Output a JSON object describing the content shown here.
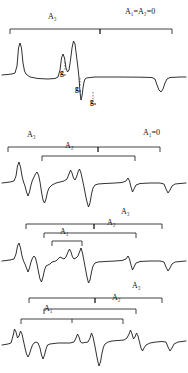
{
  "figure": {
    "type": "spectra-stack",
    "panel_count": 4,
    "background": "#ffffff",
    "trace_color": "#1a1a1a"
  },
  "labels": {
    "A3": "A₃",
    "A2": "A₂",
    "A1": "A₁",
    "g1": "g₁",
    "g2": "g₂",
    "g3": "g₃",
    "cond_top": "A₁=A₂=0",
    "cond_second": "A₁=0"
  },
  "panels": [
    {
      "index": 1,
      "condition": "A₁=A₂=0",
      "brackets": [
        {
          "label": "A₃",
          "x1": 10,
          "x2": 100,
          "y": 30,
          "label_x": 48,
          "label_y": 17
        }
      ],
      "condition_label": {
        "x": 128,
        "y": 12
      },
      "g_markers": [
        {
          "label": "g₁",
          "x": 63,
          "y": 70
        },
        {
          "label": "g₂",
          "x": 80,
          "y": 89
        },
        {
          "label": "g₃",
          "x": 94,
          "y": 101
        }
      ]
    },
    {
      "index": 2,
      "condition": "A₁=0",
      "brackets": [
        {
          "label": "A₃",
          "x1": 8,
          "x2": 160,
          "y": 148,
          "label_x": 30,
          "label_y": 136
        },
        {
          "label": "A₂",
          "x1": 42,
          "x2": 135,
          "y": 157,
          "label_x": 68,
          "label_y": 147
        }
      ],
      "condition_label": {
        "x": 146,
        "y": 133
      }
    },
    {
      "index": 3,
      "condition": "",
      "brackets": [
        {
          "label": "A₃",
          "x1": 26,
          "x2": 162,
          "y": 225,
          "label_x": 123,
          "label_y": 213
        },
        {
          "label": "A₂",
          "x1": 44,
          "x2": 136,
          "y": 234,
          "label_x": 110,
          "label_y": 224
        },
        {
          "label": "A₁",
          "x1": 52,
          "x2": 82,
          "y": 242,
          "label_x": 61,
          "label_y": 233
        }
      ]
    },
    {
      "index": 4,
      "condition": "",
      "brackets": [
        {
          "label": "A₃",
          "x1": 29,
          "x2": 162,
          "y": 299,
          "label_x": 134,
          "label_y": 287
        },
        {
          "label": "A₂",
          "x1": 44,
          "x2": 136,
          "y": 310,
          "label_x": 114,
          "label_y": 299
        },
        {
          "label": "A₁",
          "x1": 21,
          "x2": 123,
          "y": 320,
          "label_x": 46,
          "label_y": 310
        }
      ]
    }
  ],
  "chart_data": {
    "type": "line",
    "title": "",
    "xlabel": "",
    "ylabel": "",
    "grid": false,
    "legend": "none",
    "series": [
      {
        "name": "panel1",
        "note": "A1=A2=0 : one sharp positive peak, a doublet, a tall peak then a deep downward step and a trough",
        "path": "M2,75 L12,74 L15,73 L17,66 L18.5,48 L20,43 L21.5,48 L23,63 L24.5,71 L26,74 L30,77 L38,78.5 L48,79 L55,78.5 L58,77 L60,70 L61.5,58 L63,54 L64.5,58 L66,68 L67.5,72 L69,70 L70.5,60 L72,48 L73.5,41 L75,44 L76.5,56 L78,68 L79,78 L80,92 L81,100 L82,96 L83,88 L84,82 L85,79 L86.5,78 L90,77.5 L95,77 L100,77 L120,77 L140,77.2 L152,77.5 L155,79 L157,85 L159,90 L161,92 L163,89 L165,83 L167,79 L170,77.5 L180,77 L186,77"
      },
      {
        "name": "panel2",
        "note": "A1=0 : derivative-like spectrum with positive/negative excursions",
        "path": "M2,183 L10,182 L14,181 L16,176 L17.5,166 L19,162 L20.5,167 L22,176 L23.5,182 L25,186 L26.5,192 L28,196 L29.5,192 L31,185 L32.5,180 L34,177 L35.5,174 L37,172 L38.5,175 L40,182 L41.5,192 L43,200 L44.5,203 L46,199 L47.5,192 L49,188 L52,185 L56,183 L60,182 L64,181 L67,179 L69,174 L70.5,170 L72,173 L73.5,178 L75,180 L76.5,177 L78,172 L79.5,169 L81,173 L82.5,180 L84,187 L85.5,195 L87,202 L88.5,207 L90,203 L91.5,194 L93,188 L95,185 L98,184 L105,183.5 L115,183 L122,182.5 L126,181 L128,178 L129.5,181 L131,187 L132.5,192 L134,189 L136,185 L140,183.5 L150,183 L160,183 L164,184 L166,189 L168,193 L170,190 L172,186 L175,184 L180,183.5 L186,183"
      },
      {
        "name": "panel3",
        "note": "third spectrum: more structure, A1 bracket visible over a small doublet",
        "path": "M2,261 L10,260 L14,259 L16,254 L17.5,246 L19,243 L20.5,248 L22,256 L23.5,261 L25,264 L26.5,268 L28,272 L29.5,268 L31,262 L32.5,258 L34,256 L35.5,258 L37,264 L38.5,272 L40,279 L41.5,282 L43,277 L44.5,270 L46,266 L48,265 L50,264 L52,262 L54,261.5 L56,261 L58,259 L60,257 L62,258 L64,259 L66,257 L68,252 L69.5,249 L71,252 L72.5,257 L74,259 L76,258 L78,256 L79.5,252 L81,248 L82.5,253 L84,261 L85.5,269 L87,277 L88.5,283 L90,280 L91.5,272 L93,266 L95,263 L98,262 L105,261.5 L115,261 L122,260.5 L126,259 L128,256 L129.5,259 L131,265 L132.5,270 L134,267 L136,263 L140,261.5 L150,261 L160,261 L164,262 L166,267 L168,271 L170,268 L172,264 L175,262 L180,261.5 L186,261"
      },
      {
        "name": "panel4",
        "note": "fourth spectrum: fully split, A1 bracket wide over left structure",
        "path": "M2,345 L8,344 L11,343 L13,336 L14.5,329 L16,332 L17.5,338 L19,336 L20.5,331 L22,334 L23.5,341 L25,348 L26.5,354 L28,357 L29.5,354 L31,349 L32.5,345 L34,343 L36,342 L38,343 L40,348 L41.5,355 L43,359 L44.5,355 L46,349 L47.5,345 L50,344 L54,343.5 L58,343 L64,343 L70,343 L74,342 L76,338 L77.5,334 L79,337 L80.5,342 L82,343 L85,342.5 L88,342 L90,338 L91.5,333 L93,337 L94.5,344 L96,352 L97.5,360 L99,366 L100.5,362 L102,353 L103.5,347 L105,344 L108,342 L112,341 L118,340.5 L124,340 L127,338 L129,334 L130.5,330 L132,334 L133.5,339 L135,337 L136.5,333 L138,336 L139.5,342 L141,348 L142.5,351 L144,348 L146,345 L150,343 L156,342 L162,341.5 L166,342 L168,347 L170,351 L172,348 L174,344 L178,342 L182,341.5 L186,341"
      }
    ]
  }
}
